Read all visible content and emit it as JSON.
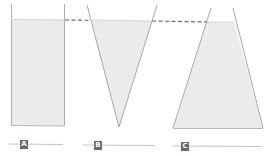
{
  "diagram": {
    "colors": {
      "water": "#ebebeb",
      "outline": "#a8a8a8",
      "dashed_line": "#6e6e6e",
      "label_bg": "#6a6a6a",
      "label_text": "#ffffff",
      "baseline": "#c4c4c4"
    },
    "containers": [
      {
        "id": "A",
        "shape": "rectangle",
        "label": "A"
      },
      {
        "id": "B",
        "shape": "inverted-triangle",
        "label": "B"
      },
      {
        "id": "C",
        "shape": "trapezoid",
        "label": "C"
      }
    ]
  }
}
